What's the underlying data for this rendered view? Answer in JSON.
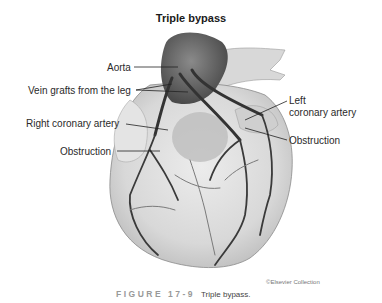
{
  "figure": {
    "title": "Triple bypass",
    "labels": {
      "aorta": "Aorta",
      "vein_grafts": "Vein grafts from the leg",
      "right_coronary": "Right coronary artery",
      "obstruction_left_side": "Obstruction",
      "left_coronary_line1": "Left",
      "left_coronary_line2": "coronary artery",
      "obstruction_right_side": "Obstruction"
    },
    "credit": "©Elsevier Collection",
    "caption": {
      "figure_number": "FIGURE 17-9",
      "text": "Triple bypass."
    }
  },
  "colors": {
    "vessel": "#3a3a3a",
    "aorta": "#6b6b6b",
    "heart_fill": "#d9d9d9",
    "caption_label": "#999999"
  }
}
